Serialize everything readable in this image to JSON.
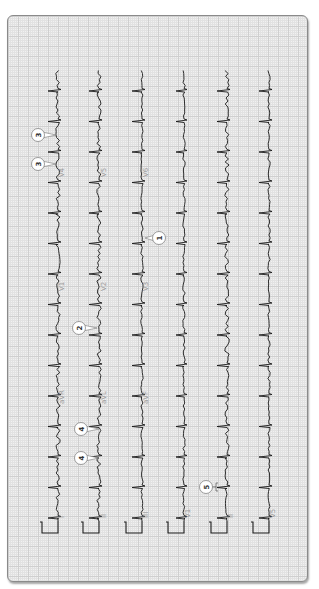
{
  "figure": {
    "orientation": "rotated 90 degrees counterclockwise",
    "grid_color": "#cfcfcf",
    "background": "#f1f1f1",
    "trace_color": "#1a1a1a",
    "label_color": "#9a9a9a"
  },
  "strips": [
    {
      "id": "strip-1",
      "baseline_x": 57,
      "labels": [
        "I",
        "aVR",
        "V1",
        "V4"
      ]
    },
    {
      "id": "strip-2",
      "baseline_x": 98,
      "labels": [
        "II",
        "aVL",
        "V2",
        "V5"
      ]
    },
    {
      "id": "strip-3",
      "baseline_x": 141,
      "labels": [
        "III",
        "aVF",
        "V3",
        "V6"
      ]
    },
    {
      "id": "strip-4",
      "baseline_x": 183,
      "labels": [
        "V1"
      ]
    },
    {
      "id": "strip-5",
      "baseline_x": 226,
      "labels": [
        "II"
      ]
    },
    {
      "id": "strip-6",
      "baseline_x": 268,
      "labels": [
        "V5"
      ]
    }
  ],
  "lead_labels": [
    {
      "text": "I",
      "x": 63,
      "y": 517
    },
    {
      "text": "aVR",
      "x": 63,
      "y": 403
    },
    {
      "text": "V1",
      "x": 63,
      "y": 290
    },
    {
      "text": "V4",
      "x": 63,
      "y": 176
    },
    {
      "text": "II",
      "x": 105,
      "y": 517
    },
    {
      "text": "aVL",
      "x": 105,
      "y": 403
    },
    {
      "text": "V2",
      "x": 105,
      "y": 290
    },
    {
      "text": "V5",
      "x": 105,
      "y": 176
    },
    {
      "text": "III",
      "x": 147,
      "y": 517
    },
    {
      "text": "aVF",
      "x": 147,
      "y": 403
    },
    {
      "text": "V3",
      "x": 147,
      "y": 290
    },
    {
      "text": "V6",
      "x": 147,
      "y": 176
    },
    {
      "text": "V1",
      "x": 189,
      "y": 517
    },
    {
      "text": "II",
      "x": 232,
      "y": 517
    },
    {
      "text": "V5",
      "x": 274,
      "y": 517
    }
  ],
  "callouts": [
    {
      "number": "1",
      "x": 158,
      "y": 237,
      "target_x": 143,
      "target_y": 237
    },
    {
      "number": "2",
      "x": 78,
      "y": 327,
      "target_x": 97,
      "target_y": 327
    },
    {
      "number": "3",
      "x": 37,
      "y": 134,
      "target_x": 56,
      "target_y": 134
    },
    {
      "number": "3",
      "x": 37,
      "y": 163,
      "target_x": 56,
      "target_y": 163
    },
    {
      "number": "4",
      "x": 80,
      "y": 428,
      "target_x": 99,
      "target_y": 428
    },
    {
      "number": "4",
      "x": 80,
      "y": 457,
      "target_x": 99,
      "target_y": 457
    },
    {
      "number": "5",
      "x": 205,
      "y": 486,
      "target_x": 216,
      "target_y": 486
    }
  ],
  "beats": {
    "count": 15,
    "first_y": 90,
    "interval_px": 30.5
  },
  "calibration_pulse": {
    "top_y": 520,
    "bottom_y": 532,
    "width_px": 12
  }
}
